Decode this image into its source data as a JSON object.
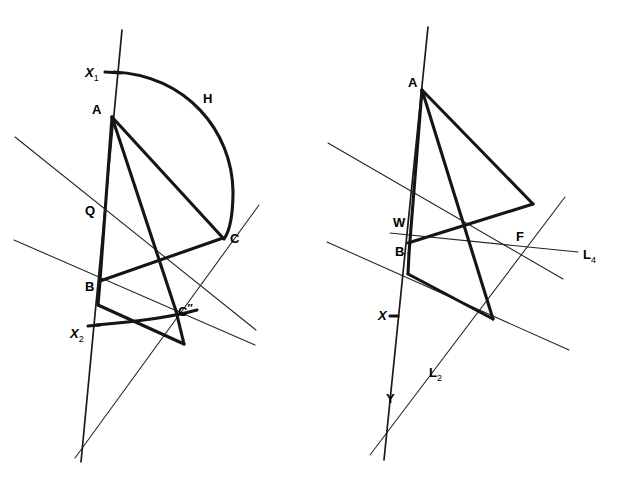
{
  "page": {
    "width": 618,
    "height": 481,
    "background": "#ffffff",
    "ink_color": "#151515"
  },
  "figures": [
    {
      "id": "left-figure",
      "name": "Construction with circular arc H",
      "labels": [
        {
          "id": "X1",
          "base": "X",
          "sub": "1",
          "prime": "",
          "italic": true,
          "x": 85,
          "y": 77
        },
        {
          "id": "A",
          "base": "A",
          "sub": "",
          "prime": "",
          "italic": false,
          "x": 92,
          "y": 114
        },
        {
          "id": "H",
          "base": "H",
          "sub": "",
          "prime": "",
          "italic": false,
          "x": 203,
          "y": 103
        },
        {
          "id": "Q",
          "base": "Q",
          "sub": "",
          "prime": "",
          "italic": false,
          "x": 85,
          "y": 215
        },
        {
          "id": "C",
          "base": "C",
          "sub": "",
          "prime": "",
          "italic": false,
          "x": 230,
          "y": 243
        },
        {
          "id": "B",
          "base": "B",
          "sub": "",
          "prime": "",
          "italic": false,
          "x": 85,
          "y": 291
        },
        {
          "id": "C2",
          "base": "C",
          "sub": "",
          "prime": "″",
          "italic": false,
          "x": 178,
          "y": 316
        },
        {
          "id": "X2",
          "base": "X",
          "sub": "2",
          "prime": "",
          "italic": true,
          "x": 70,
          "y": 338
        }
      ]
    },
    {
      "id": "right-figure",
      "name": "Construction with lines L2 and L4",
      "labels": [
        {
          "id": "A",
          "base": "A",
          "sub": "",
          "prime": "",
          "italic": false,
          "x": 408,
          "y": 87
        },
        {
          "id": "W",
          "base": "W",
          "sub": "",
          "prime": "",
          "italic": false,
          "x": 393,
          "y": 227
        },
        {
          "id": "F",
          "base": "F",
          "sub": "",
          "prime": "",
          "italic": false,
          "x": 516,
          "y": 241
        },
        {
          "id": "L4",
          "base": "L",
          "sub": "4",
          "prime": "",
          "italic": false,
          "x": 583,
          "y": 259
        },
        {
          "id": "B",
          "base": "B",
          "sub": "",
          "prime": "",
          "italic": false,
          "x": 395,
          "y": 256
        },
        {
          "id": "X",
          "base": "X",
          "sub": "",
          "prime": "",
          "italic": true,
          "x": 378,
          "y": 320
        },
        {
          "id": "L2",
          "base": "L",
          "sub": "2",
          "prime": "",
          "italic": false,
          "x": 429,
          "y": 377
        },
        {
          "id": "Y",
          "base": "Y",
          "sub": "",
          "prime": "",
          "italic": false,
          "x": 386,
          "y": 403
        }
      ]
    }
  ],
  "geometry": {
    "left": {
      "vertical_line": {
        "x1": 122,
        "y1": 30,
        "x2": 81,
        "y2": 462
      },
      "side_AB": {
        "x1": 112,
        "y1": 117,
        "x2": 100,
        "y2": 281
      },
      "arc_H": "M 114 72 C 185 74 231 130 233 190 C 234 218 230 232 224 239",
      "arc_X2": "M 96 325 C 130 322 170 318 196 312",
      "segment_AC": {
        "x1": 112,
        "y1": 117,
        "x2": 223,
        "y2": 238
      },
      "segment_A_Cpp": {
        "x1": 112,
        "y1": 117,
        "x2": 176,
        "y2": 310
      },
      "segment_BC": {
        "x1": 100,
        "y1": 281,
        "x2": 223,
        "y2": 238
      },
      "segment_B_low": {
        "x1": 100,
        "y1": 281,
        "x2": 98,
        "y2": 305
      },
      "segment_low_Cpp": {
        "x1": 98,
        "y1": 305,
        "x2": 183,
        "y2": 343
      },
      "segment_Cpp_tail": {
        "x1": 176,
        "y1": 310,
        "x2": 183,
        "y2": 343
      },
      "thin_line_1": {
        "x1": 15,
        "y1": 137,
        "x2": 256,
        "y2": 330
      },
      "thin_line_2": {
        "x1": 14,
        "y1": 240,
        "x2": 255,
        "y2": 345
      },
      "thin_line_3": {
        "x1": 75,
        "y1": 458,
        "x2": 259,
        "y2": 205
      }
    },
    "right": {
      "vertical_line": {
        "x1": 428,
        "y1": 27,
        "x2": 384,
        "y2": 460
      },
      "side_AB": {
        "x1": 422,
        "y1": 90,
        "x2": 409,
        "y2": 253
      },
      "segment_A_G": {
        "x1": 422,
        "y1": 90,
        "x2": 533,
        "y2": 204
      },
      "segment_A_low": {
        "x1": 422,
        "y1": 90,
        "x2": 492,
        "y2": 318
      },
      "segment_G_W": {
        "x1": 533,
        "y1": 204,
        "x2": 409,
        "y2": 243
      },
      "segment_B_low": {
        "x1": 409,
        "y1": 253,
        "x2": 408,
        "y2": 274
      },
      "segment_low_E": {
        "x1": 408,
        "y1": 274,
        "x2": 492,
        "y2": 318
      },
      "thin_line_L4": {
        "x1": 390,
        "y1": 233,
        "x2": 578,
        "y2": 252
      },
      "thin_line_a": {
        "x1": 328,
        "y1": 143,
        "x2": 563,
        "y2": 279
      },
      "thin_line_b": {
        "x1": 327,
        "y1": 242,
        "x2": 569,
        "y2": 350
      },
      "thin_line_L2": {
        "x1": 370,
        "y1": 455,
        "x2": 565,
        "y2": 197
      }
    }
  }
}
